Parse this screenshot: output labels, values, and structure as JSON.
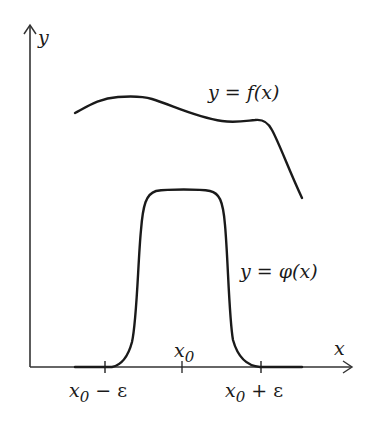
{
  "diagram": {
    "axes": {
      "x_label": "x",
      "y_label": "y",
      "color": "#333333"
    },
    "curves": [
      {
        "id": "f",
        "label_var": "y",
        "label_eq": " = ",
        "label_fn": "f(x)",
        "color": "#1a1a1a"
      },
      {
        "id": "phi",
        "label_var": "y",
        "label_eq": " = ",
        "label_fn": "φ(x)",
        "color": "#1a1a1a"
      }
    ],
    "ticks": [
      {
        "id": "x0-minus-eps",
        "base": "x",
        "sub": "0",
        "op": " − ",
        "rest": "ε"
      },
      {
        "id": "x0",
        "base": "x",
        "sub": "0"
      },
      {
        "id": "x0-plus-eps",
        "base": "x",
        "sub": "0",
        "op": " + ",
        "rest": "ε"
      }
    ]
  }
}
